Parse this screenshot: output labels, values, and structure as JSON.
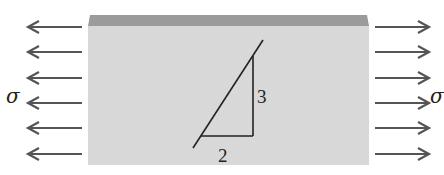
{
  "figure": {
    "type": "plate-under-uniaxial-tension",
    "colors": {
      "block_face": "#dadada",
      "block_top": "#9b9b9b",
      "arrow": "#555555",
      "line": "#222222"
    },
    "block": {
      "x": 88,
      "y": 15,
      "width": 281,
      "height": 150,
      "top_thickness": 11
    },
    "arrows_left": {
      "x_tip": 28,
      "x_tail": 82,
      "y": [
        27,
        52,
        78,
        103,
        128,
        154
      ]
    },
    "arrows_right": {
      "x_tail": 375,
      "x_tip": 429,
      "y": [
        27,
        52,
        78,
        103,
        128,
        154
      ]
    },
    "left_label": "σ",
    "right_label": "σ",
    "slope_triangle": {
      "rise_label": "3",
      "run_label": "2",
      "line": {
        "x1": 193,
        "y1": 148,
        "x2": 263,
        "y2": 40
      },
      "vertical": {
        "x": 253,
        "y1": 56,
        "y2": 136
      },
      "horizontal": {
        "x1": 201,
        "x2": 253,
        "y": 136
      }
    }
  }
}
